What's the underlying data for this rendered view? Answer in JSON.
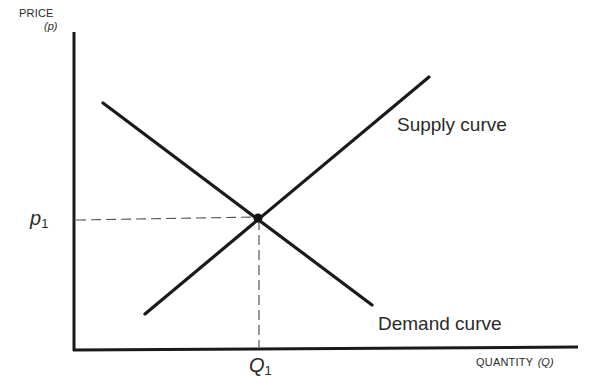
{
  "diagram": {
    "y_axis": {
      "label": "PRICE",
      "symbol": "(p)"
    },
    "x_axis": {
      "label": "QUANTITY",
      "symbol": "(Q)"
    },
    "curves": [
      {
        "name": "Supply curve",
        "slope": "upward"
      },
      {
        "name": "Demand curve",
        "slope": "downward"
      }
    ],
    "equilibrium": {
      "price_label": "p",
      "price_subscript": "1",
      "quantity_label": "Q",
      "quantity_subscript": "1"
    },
    "colors": {
      "line": "#1a1a1a",
      "dashed": "#555555",
      "background": "#ffffff"
    }
  }
}
